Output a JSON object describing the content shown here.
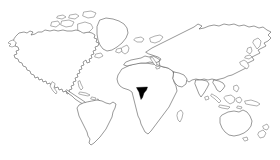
{
  "figure": {
    "kind": "world-map",
    "title": "",
    "caption": "",
    "width": 280,
    "height": 160
  },
  "colors": {
    "background": "#ffffff",
    "outline": "#5a5a5a",
    "island_outline": "#6e6e6e",
    "highlight_fill": "#000000"
  },
  "map": {
    "projection": "equirectangular",
    "base_fill": "#ffffff",
    "stroke_width": 0.62,
    "graticule": false,
    "labels_visible": false,
    "legend_visible": false,
    "regions": [
      {
        "id": "north-america",
        "label": "North America",
        "highlighted": false
      },
      {
        "id": "greenland",
        "label": "Greenland",
        "highlighted": false
      },
      {
        "id": "south-america",
        "label": "South America",
        "highlighted": false
      },
      {
        "id": "africa",
        "label": "Africa",
        "highlighted": false
      },
      {
        "id": "eurasia",
        "label": "Eurasia",
        "highlighted": false
      },
      {
        "id": "australia",
        "label": "Australia",
        "highlighted": false
      },
      {
        "id": "new-zealand",
        "label": "New Zealand",
        "highlighted": false
      },
      {
        "id": "indonesia",
        "label": "Indonesia",
        "highlighted": false
      },
      {
        "id": "japan",
        "label": "Japan",
        "highlighted": false
      },
      {
        "id": "british-isles",
        "label": "British Isles",
        "highlighted": false
      },
      {
        "id": "madagascar",
        "label": "Madagascar",
        "highlighted": false
      },
      {
        "id": "west-africa-highlight",
        "label": "West Africa",
        "highlighted": true
      }
    ],
    "highlighted_region": {
      "id": "west-africa-highlight",
      "label": "West Africa",
      "fill": "#000000",
      "center_x": 142,
      "center_y": 92
    }
  }
}
